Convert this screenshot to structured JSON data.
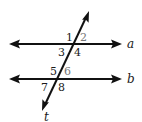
{
  "diagram": {
    "type": "parallel-lines-cut-by-transversal",
    "colors": {
      "background": "#ffffff",
      "line": "#111111",
      "label_dark": "#1a1a1a",
      "label_light": "#777777"
    },
    "lines": [
      {
        "id": "a",
        "label": "a",
        "y": 44,
        "x1": 9,
        "x2": 122
      },
      {
        "id": "b",
        "label": "b",
        "y": 79,
        "x1": 9,
        "x2": 122
      }
    ],
    "transversal": {
      "label": "t",
      "x1": 42,
      "y1": 111,
      "x2": 89,
      "y2": 11
    },
    "angles": [
      {
        "label": "1",
        "x": 66,
        "y": 41,
        "shade": "dark"
      },
      {
        "label": "2",
        "x": 80,
        "y": 41,
        "shade": "light"
      },
      {
        "label": "3",
        "x": 58,
        "y": 56,
        "shade": "dark"
      },
      {
        "label": "4",
        "x": 74,
        "y": 56,
        "shade": "dark"
      },
      {
        "label": "5",
        "x": 50,
        "y": 75,
        "shade": "dark"
      },
      {
        "label": "6",
        "x": 64,
        "y": 75,
        "shade": "light"
      },
      {
        "label": "7",
        "x": 41,
        "y": 91,
        "shade": "dark"
      },
      {
        "label": "8",
        "x": 58,
        "y": 91,
        "shade": "dark"
      }
    ]
  }
}
